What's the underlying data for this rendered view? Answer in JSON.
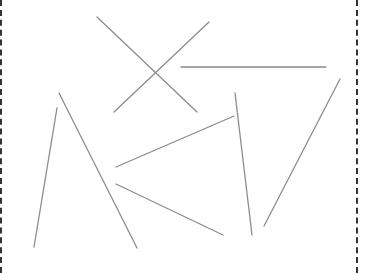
{
  "diagram": {
    "stroke_color": "#8c8c8c",
    "border_color": "#333333",
    "background": "#ffffff",
    "segments": [
      {
        "id": "a",
        "x1": 97,
        "y1": 17,
        "x2": 197,
        "y2": 112
      },
      {
        "id": "b",
        "x1": 209,
        "y1": 22,
        "x2": 114,
        "y2": 112
      },
      {
        "id": "c",
        "x1": 181,
        "y1": 67,
        "x2": 326,
        "y2": 67
      },
      {
        "id": "d",
        "x1": 59,
        "y1": 93,
        "x2": 137,
        "y2": 248
      },
      {
        "id": "e",
        "x1": 57,
        "y1": 108,
        "x2": 34,
        "y2": 247
      },
      {
        "id": "f",
        "x1": 116,
        "y1": 167,
        "x2": 234,
        "y2": 116
      },
      {
        "id": "g",
        "x1": 116,
        "y1": 184,
        "x2": 223,
        "y2": 235
      },
      {
        "id": "h",
        "x1": 235,
        "y1": 93,
        "x2": 252,
        "y2": 235
      },
      {
        "id": "i",
        "x1": 340,
        "y1": 79,
        "x2": 264,
        "y2": 226
      }
    ]
  }
}
